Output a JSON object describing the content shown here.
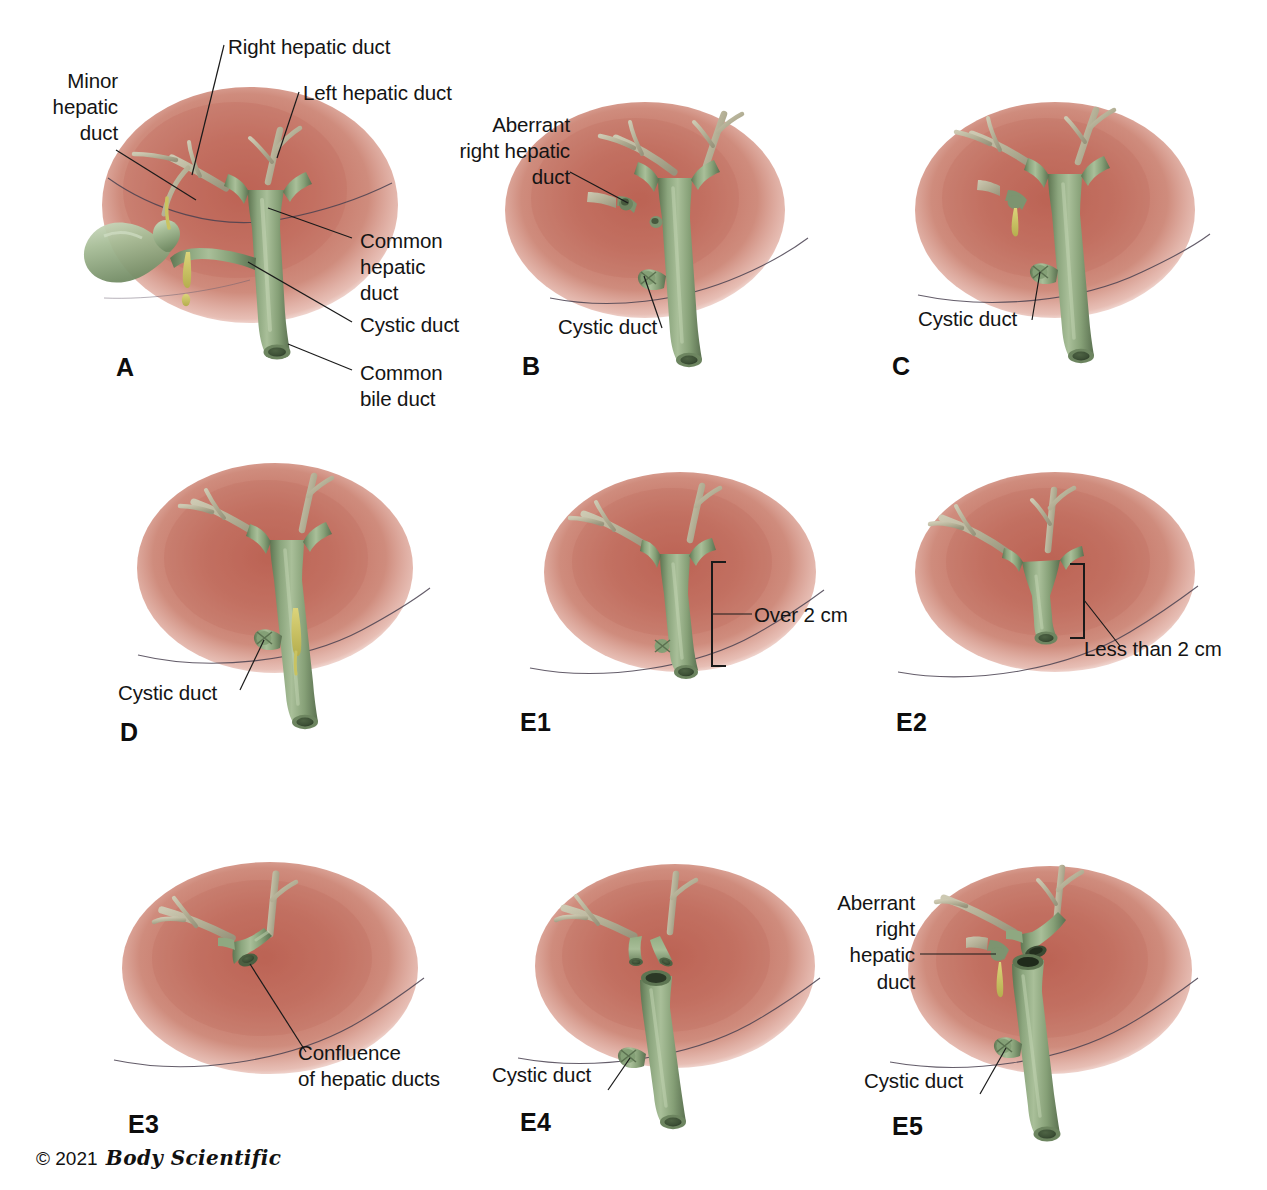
{
  "figure": {
    "width": 1267,
    "height": 1190,
    "background": "#ffffff"
  },
  "colors": {
    "liver_core": "#c06a5c",
    "liver_mid": "#cb8274",
    "liver_edge": "#e8bcb3",
    "duct_green": "#8aa37c",
    "duct_green_dark": "#5d7552",
    "duct_green_light": "#b8c9a8",
    "bile_yellow": "#c9c361",
    "intrahepatic_tan": "#b9b59a",
    "contour_line": "#3a3540",
    "text": "#141414",
    "leader_line": "#1a1a1a"
  },
  "copyright": {
    "symbol": "©",
    "year": "2021",
    "brand": "Body Scientific"
  },
  "panels": [
    {
      "id": "A",
      "letter": "A",
      "labels": [
        {
          "name": "minor-hepatic-duct",
          "text": "Minor\nhepatic\nduct"
        },
        {
          "name": "right-hepatic-duct",
          "text": "Right hepatic duct"
        },
        {
          "name": "left-hepatic-duct",
          "text": "Left hepatic duct"
        },
        {
          "name": "common-hepatic-duct",
          "text": "Common\nhepatic\nduct"
        },
        {
          "name": "cystic-duct",
          "text": "Cystic duct"
        },
        {
          "name": "common-bile-duct",
          "text": "Common\nbile duct"
        }
      ]
    },
    {
      "id": "B",
      "letter": "B",
      "labels": [
        {
          "name": "aberrant-right-hepatic-duct",
          "text": "Aberrant\nright hepatic\nduct"
        },
        {
          "name": "cystic-duct",
          "text": "Cystic duct"
        }
      ]
    },
    {
      "id": "C",
      "letter": "C",
      "labels": [
        {
          "name": "cystic-duct",
          "text": "Cystic duct"
        }
      ]
    },
    {
      "id": "D",
      "letter": "D",
      "labels": [
        {
          "name": "cystic-duct",
          "text": "Cystic duct"
        }
      ]
    },
    {
      "id": "E1",
      "letter": "E1",
      "labels": [
        {
          "name": "over-2-cm",
          "text": "Over 2 cm"
        }
      ]
    },
    {
      "id": "E2",
      "letter": "E2",
      "labels": [
        {
          "name": "less-than-2-cm",
          "text": "Less than 2 cm"
        }
      ]
    },
    {
      "id": "E3",
      "letter": "E3",
      "labels": [
        {
          "name": "confluence-of-hepatic-ducts",
          "text": "Confluence\nof hepatic ducts"
        }
      ]
    },
    {
      "id": "E4",
      "letter": "E4",
      "labels": [
        {
          "name": "cystic-duct",
          "text": "Cystic duct"
        }
      ]
    },
    {
      "id": "E5",
      "letter": "E5",
      "labels": [
        {
          "name": "aberrant-right-hepatic-duct",
          "text": "Aberrant\nright hepatic\nduct"
        },
        {
          "name": "cystic-duct",
          "text": "Cystic duct"
        }
      ]
    }
  ]
}
